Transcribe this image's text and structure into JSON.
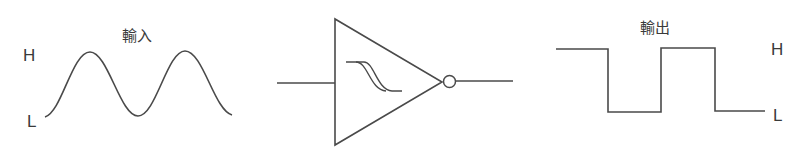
{
  "diagram": {
    "input": {
      "title": "輸入",
      "high_label": "H",
      "low_label": "L",
      "waveform": "sine"
    },
    "gate": {
      "symbol": "inverter-triangle",
      "inner_symbol": "hysteresis",
      "output_bubble": true
    },
    "output": {
      "title": "輸出",
      "high_label": "H",
      "low_label": "L",
      "waveform": "square"
    },
    "colors": {
      "stroke": "#4a4a4a",
      "text": "#3a3a3a",
      "background": "#ffffff"
    }
  }
}
